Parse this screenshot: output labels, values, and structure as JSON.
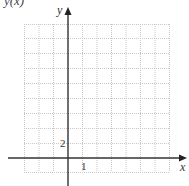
{
  "figure": {
    "function_label": "y(x)",
    "axes": {
      "x_label": "x",
      "y_label": "y",
      "x_tick_label": "1",
      "y_tick_label": "2"
    },
    "grid": {
      "columns": 10,
      "rows_above_x_axis": 9,
      "rows_below_x_axis": 1,
      "columns_left_of_y_axis": 3,
      "x_unit_per_column": 1,
      "y_unit_per_row": 2,
      "line_style": "dotted",
      "line_color": "#c8c8c8",
      "axis_color": "#333333"
    }
  }
}
